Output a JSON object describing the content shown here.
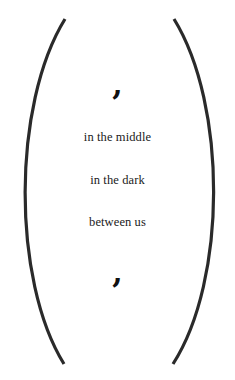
{
  "poem": {
    "top_mark": ",",
    "lines": [
      "in the middle",
      "in the dark",
      "between us"
    ],
    "bottom_mark": ","
  },
  "colors": {
    "background": "#ffffff",
    "stroke": "#2a2a2a",
    "text": "#1a1a1a"
  }
}
